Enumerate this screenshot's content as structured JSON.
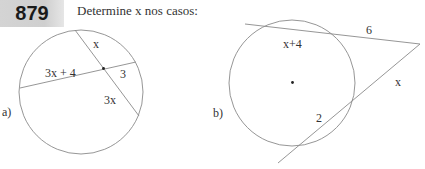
{
  "exercise": {
    "number": "879",
    "instruction": "Determine x nos casos:"
  },
  "figures": {
    "a": {
      "label": "a)",
      "segment_labels": {
        "upper_chord_part": "x",
        "left_chord_part": "3x + 4",
        "right_chord_part": "3",
        "lower_chord_part": "3x"
      }
    },
    "b": {
      "label": "b)",
      "segment_labels": {
        "upper_internal": "x+4",
        "upper_external": "6",
        "lower_external": "x",
        "lower_internal": "2"
      }
    }
  },
  "colors": {
    "line": "#8a8a8a",
    "text": "#333333",
    "badge_bg": "#d0d0d0"
  }
}
